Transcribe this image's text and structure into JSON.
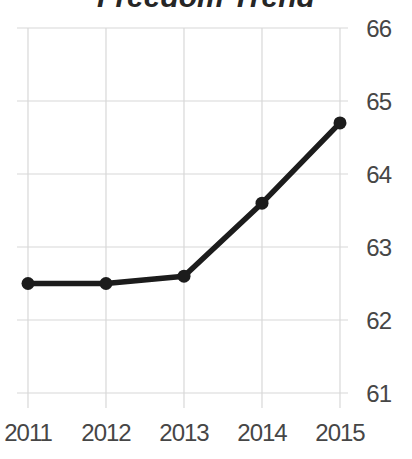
{
  "title": "Freedom Trend",
  "chart_data": {
    "type": "line",
    "title": "Freedom Trend",
    "x": [
      "2011",
      "2012",
      "2013",
      "2014",
      "2015"
    ],
    "series": [
      {
        "name": "Freedom Trend",
        "values": [
          62.5,
          62.5,
          62.6,
          63.6,
          64.7
        ]
      }
    ],
    "xlabel": "",
    "ylabel": "",
    "ylim": [
      61,
      66
    ],
    "yticks": [
      66,
      65,
      64,
      63,
      62,
      61
    ],
    "ytick_side": "right",
    "grid": true,
    "legend_position": "none",
    "line_color": "#1c1c1c",
    "marker": "circle",
    "marker_color": "#1c1c1c",
    "grid_color": "#d8d8d8",
    "label_color": "#464646",
    "title_color": "#262626",
    "background_color": "#ffffff"
  }
}
